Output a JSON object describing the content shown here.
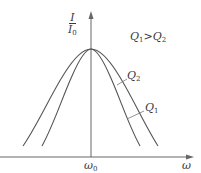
{
  "figure": {
    "type": "resonance-curves",
    "y_axis": {
      "label_numerator": "I",
      "label_denominator": "I",
      "label_denominator_sub": "0"
    },
    "x_axis": {
      "label": "ω",
      "center_label": "ω",
      "center_label_sub": "0"
    },
    "condition": {
      "left": "Q",
      "left_sub": "1",
      "op": ">",
      "right": "Q",
      "right_sub": "2"
    },
    "curves": [
      {
        "name": "Q",
        "sub": "2",
        "description": "wider curve (lower Q)"
      },
      {
        "name": "Q",
        "sub": "1",
        "description": "narrower curve (higher Q)"
      }
    ],
    "colors": {
      "line": "#555555",
      "text": "#3a3a3a",
      "background": "#ffffff"
    }
  }
}
